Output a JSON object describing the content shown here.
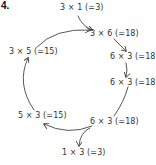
{
  "problem_number": "4.",
  "nodes": [
    {
      "id": "top",
      "text": "3 × 1 (=3)"
    },
    {
      "id": "upper-right",
      "text": "3 × 6 (=18)"
    },
    {
      "id": "right-1",
      "text": "6 × 3 (=18)"
    },
    {
      "id": "right-2",
      "text": "6 × 3 (=18)"
    },
    {
      "id": "lower-right",
      "text": "6 × 3 (=18)"
    },
    {
      "id": "bottom",
      "text": "1 × 3 (=3)"
    },
    {
      "id": "lower-left",
      "text": "5 × 3 (=15)"
    },
    {
      "id": "upper-left",
      "text": "3 × 5 (=15)"
    }
  ],
  "edges": [
    {
      "from": "top",
      "to": "upper-right"
    },
    {
      "from": "upper-left",
      "to": "upper-right"
    },
    {
      "from": "upper-right",
      "to": "right-1"
    },
    {
      "from": "right-1",
      "to": "right-2"
    },
    {
      "from": "right-2",
      "to": "lower-right"
    },
    {
      "from": "lower-right",
      "to": "lower-left"
    },
    {
      "from": "lower-right",
      "to": "bottom"
    },
    {
      "from": "lower-left",
      "to": "upper-left"
    }
  ],
  "colors": {
    "ink": "#333333",
    "background": "#ffffff"
  }
}
